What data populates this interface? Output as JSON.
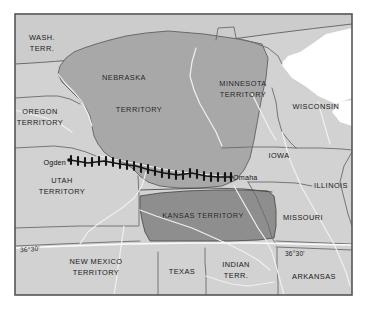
{
  "figure": {
    "kind": "historical-map",
    "width": 367,
    "height": 309
  },
  "colors": {
    "page_background": "#ffffff",
    "map_background": "#d2d2d2",
    "frame_border": "#555555",
    "nebraska_territory_fill": "#a8a8a8",
    "kansas_territory_fill": "#8e8e8e",
    "lake_fill": "#ffffff",
    "state_border": "#6b6b6b",
    "river": "#f2f2f2",
    "railroad": "#141414",
    "label_text": "#1a1a1a"
  },
  "frame": {
    "x": 14,
    "y": 13,
    "width": 339,
    "height": 283
  },
  "territory_labels": [
    {
      "name": "washington-territory",
      "lines": [
        "WASH.",
        "TERR."
      ],
      "x": 42,
      "y": 43
    },
    {
      "name": "oregon-territory",
      "lines": [
        "OREGON",
        "TERRITORY"
      ],
      "x": 40,
      "y": 117
    },
    {
      "name": "nebraska-territory",
      "lines": [
        "NEBRASKA"
      ],
      "x": 124,
      "y": 78
    },
    {
      "name": "nebraska-territory-word2",
      "lines": [
        "TERRITORY"
      ],
      "x": 139,
      "y": 110
    },
    {
      "name": "minnesota-territory",
      "lines": [
        "MINNESOTA",
        "TERRITORY"
      ],
      "x": 243,
      "y": 89
    },
    {
      "name": "wisconsin",
      "lines": [
        "WISCONSIN"
      ],
      "x": 316,
      "y": 107
    },
    {
      "name": "iowa",
      "lines": [
        "IOWA"
      ],
      "x": 279,
      "y": 156
    },
    {
      "name": "illinois",
      "lines": [
        "ILLINOIS"
      ],
      "x": 331,
      "y": 186
    },
    {
      "name": "utah-territory",
      "lines": [
        "UTAH",
        "TERRITORY"
      ],
      "x": 62,
      "y": 186
    },
    {
      "name": "kansas-territory",
      "lines": [
        "KANSAS   TERRITORY"
      ],
      "x": 203,
      "y": 216
    },
    {
      "name": "missouri",
      "lines": [
        "MISSOURI"
      ],
      "x": 303,
      "y": 218
    },
    {
      "name": "new-mexico-territory",
      "lines": [
        "NEW MEXICO",
        "TERRITORY"
      ],
      "x": 96,
      "y": 267
    },
    {
      "name": "texas",
      "lines": [
        "TEXAS"
      ],
      "x": 182,
      "y": 272
    },
    {
      "name": "indian-territory",
      "lines": [
        "INDIAN",
        "TERR."
      ],
      "x": 236,
      "y": 270
    },
    {
      "name": "arkansas",
      "lines": [
        "ARKANSAS",
        ""
      ],
      "x": 314,
      "y": 277
    }
  ],
  "city_labels": [
    {
      "name": "ogden",
      "text": "Ogden",
      "x": 42,
      "y": 162,
      "align": "left"
    },
    {
      "name": "omaha",
      "text": "Omaha",
      "x": 233,
      "y": 177,
      "align": "right"
    }
  ],
  "latitude_labels": [
    {
      "name": "lat-36-30-west",
      "text": "36°30'",
      "x": 20,
      "y": 249
    },
    {
      "name": "lat-36-30-east",
      "text": "36°30'",
      "x": 285,
      "y": 253
    }
  ],
  "railroad": {
    "name": "transcontinental-railroad",
    "description": "hatched black rail line from Ogden to Omaha",
    "start_city": "Ogden",
    "end_city": "Omaha",
    "path": "M70,160 L88,163 L104,161 L120,164 L136,166 L150,170 L164,173 L178,175 L192,173 L206,176 L218,177 L230,177",
    "tie_count": 24
  }
}
